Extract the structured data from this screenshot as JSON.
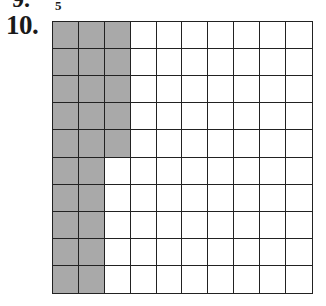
{
  "previous_problem": {
    "label": "9.",
    "fraction_denominator": "5"
  },
  "problem": {
    "number": "10.",
    "grid": {
      "rows": 10,
      "cols": 10,
      "shaded_color": "#a9a9a9",
      "unshaded_color": "#ffffff",
      "line_color": "#222222",
      "shaded_per_row": [
        3,
        3,
        3,
        3,
        3,
        2,
        2,
        2,
        2,
        2
      ],
      "total_shaded": 25,
      "total_cells": 100
    }
  }
}
